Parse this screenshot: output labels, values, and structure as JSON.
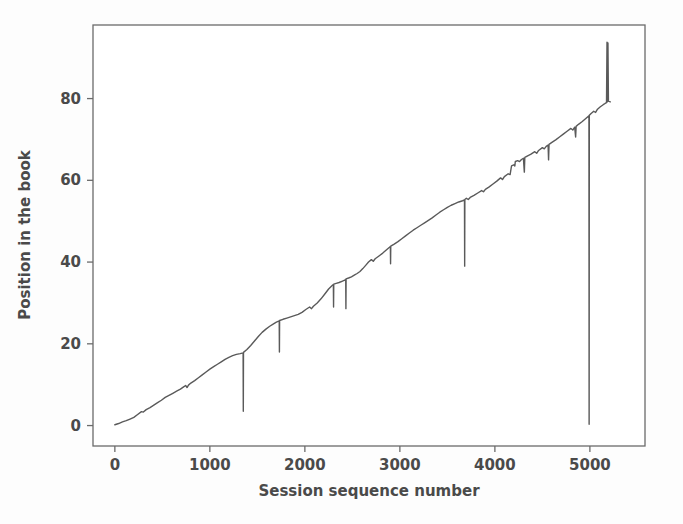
{
  "figure": {
    "background_color": "#fdfdfd",
    "line_color": "#5a5a5a",
    "axis_color": "#6b6b6b",
    "text_color": "#4a4a4a"
  },
  "chart_data": {
    "type": "line",
    "title": "",
    "xlabel": "Session sequence number",
    "ylabel": "Position in the book",
    "xlim": [
      -230,
      5580
    ],
    "ylim": [
      -5,
      98
    ],
    "xticks": [
      0,
      1000,
      2000,
      3000,
      4000,
      5000
    ],
    "xtick_labels": [
      "0",
      "1000",
      "2000",
      "3000",
      "4000",
      "5000"
    ],
    "yticks": [
      0,
      20,
      40,
      60,
      80
    ],
    "ytick_labels": [
      "0",
      "20",
      "40",
      "60",
      "80"
    ],
    "grid": false,
    "legend": null,
    "series": [
      {
        "name": "reading position",
        "color": "#5a5a5a",
        "linewidth": 1.4,
        "points": [
          [
            0,
            0.2
          ],
          [
            40,
            0.5
          ],
          [
            80,
            0.9
          ],
          [
            120,
            1.2
          ],
          [
            160,
            1.6
          ],
          [
            200,
            2.0
          ],
          [
            240,
            2.7
          ],
          [
            280,
            3.4
          ],
          [
            300,
            3.3
          ],
          [
            330,
            3.9
          ],
          [
            370,
            4.4
          ],
          [
            410,
            5.0
          ],
          [
            450,
            5.6
          ],
          [
            490,
            6.2
          ],
          [
            530,
            6.9
          ],
          [
            570,
            7.4
          ],
          [
            610,
            7.9
          ],
          [
            650,
            8.4
          ],
          [
            690,
            8.9
          ],
          [
            720,
            9.4
          ],
          [
            745,
            9.8
          ],
          [
            760,
            9.3
          ],
          [
            775,
            9.9
          ],
          [
            800,
            10.4
          ],
          [
            840,
            11.0
          ],
          [
            880,
            11.7
          ],
          [
            920,
            12.4
          ],
          [
            960,
            13.1
          ],
          [
            1000,
            13.8
          ],
          [
            1040,
            14.4
          ],
          [
            1080,
            15.0
          ],
          [
            1120,
            15.6
          ],
          [
            1160,
            16.2
          ],
          [
            1200,
            16.7
          ],
          [
            1240,
            17.1
          ],
          [
            1280,
            17.4
          ],
          [
            1320,
            17.6
          ],
          [
            1350,
            17.8
          ],
          [
            1352,
            3.5
          ],
          [
            1354,
            17.9
          ],
          [
            1390,
            18.6
          ],
          [
            1430,
            19.6
          ],
          [
            1470,
            20.7
          ],
          [
            1510,
            21.8
          ],
          [
            1550,
            22.8
          ],
          [
            1590,
            23.6
          ],
          [
            1630,
            24.3
          ],
          [
            1670,
            24.9
          ],
          [
            1700,
            25.3
          ],
          [
            1730,
            25.6
          ],
          [
            1732,
            18.0
          ],
          [
            1734,
            25.7
          ],
          [
            1770,
            26.0
          ],
          [
            1810,
            26.3
          ],
          [
            1850,
            26.6
          ],
          [
            1890,
            26.9
          ],
          [
            1930,
            27.2
          ],
          [
            1970,
            27.7
          ],
          [
            2010,
            28.4
          ],
          [
            2050,
            29.0
          ],
          [
            2070,
            28.6
          ],
          [
            2090,
            29.2
          ],
          [
            2130,
            30.0
          ],
          [
            2170,
            31.0
          ],
          [
            2210,
            32.2
          ],
          [
            2250,
            33.4
          ],
          [
            2290,
            34.3
          ],
          [
            2300,
            34.5
          ],
          [
            2302,
            29.0
          ],
          [
            2304,
            34.6
          ],
          [
            2330,
            34.8
          ],
          [
            2360,
            35.0
          ],
          [
            2390,
            35.3
          ],
          [
            2420,
            35.6
          ],
          [
            2430,
            35.8
          ],
          [
            2432,
            28.6
          ],
          [
            2434,
            35.9
          ],
          [
            2460,
            36.1
          ],
          [
            2490,
            36.4
          ],
          [
            2520,
            36.8
          ],
          [
            2550,
            37.2
          ],
          [
            2580,
            37.7
          ],
          [
            2610,
            38.4
          ],
          [
            2640,
            39.2
          ],
          [
            2670,
            40.0
          ],
          [
            2700,
            40.6
          ],
          [
            2720,
            40.2
          ],
          [
            2740,
            40.8
          ],
          [
            2780,
            41.5
          ],
          [
            2820,
            42.2
          ],
          [
            2860,
            43.0
          ],
          [
            2900,
            43.8
          ],
          [
            2902,
            39.6
          ],
          [
            2904,
            43.9
          ],
          [
            2940,
            44.4
          ],
          [
            2980,
            45.0
          ],
          [
            3020,
            45.7
          ],
          [
            3060,
            46.4
          ],
          [
            3100,
            47.1
          ],
          [
            3140,
            47.8
          ],
          [
            3180,
            48.4
          ],
          [
            3220,
            49.0
          ],
          [
            3260,
            49.6
          ],
          [
            3300,
            50.2
          ],
          [
            3340,
            50.8
          ],
          [
            3380,
            51.5
          ],
          [
            3420,
            52.2
          ],
          [
            3460,
            52.8
          ],
          [
            3500,
            53.4
          ],
          [
            3540,
            53.9
          ],
          [
            3580,
            54.3
          ],
          [
            3620,
            54.7
          ],
          [
            3660,
            55.0
          ],
          [
            3680,
            55.2
          ],
          [
            3682,
            39.0
          ],
          [
            3684,
            55.3
          ],
          [
            3700,
            55.6
          ],
          [
            3720,
            55.3
          ],
          [
            3740,
            55.8
          ],
          [
            3780,
            56.3
          ],
          [
            3820,
            56.9
          ],
          [
            3860,
            57.5
          ],
          [
            3880,
            57.2
          ],
          [
            3900,
            57.8
          ],
          [
            3940,
            58.4
          ],
          [
            3980,
            59.1
          ],
          [
            4020,
            59.8
          ],
          [
            4060,
            60.6
          ],
          [
            4080,
            60.2
          ],
          [
            4100,
            60.9
          ],
          [
            4140,
            61.6
          ],
          [
            4160,
            61.4
          ],
          [
            4175,
            63.5
          ],
          [
            4180,
            63.6
          ],
          [
            4200,
            63.8
          ],
          [
            4210,
            63.5
          ],
          [
            4215,
            64.6
          ],
          [
            4240,
            64.8
          ],
          [
            4260,
            64.6
          ],
          [
            4280,
            65.1
          ],
          [
            4300,
            65.4
          ],
          [
            4310,
            62.0
          ],
          [
            4315,
            65.6
          ],
          [
            4340,
            65.9
          ],
          [
            4380,
            66.4
          ],
          [
            4420,
            67.0
          ],
          [
            4440,
            66.6
          ],
          [
            4460,
            67.3
          ],
          [
            4500,
            68.0
          ],
          [
            4520,
            67.7
          ],
          [
            4540,
            68.3
          ],
          [
            4560,
            68.6
          ],
          [
            4565,
            65.0
          ],
          [
            4570,
            68.8
          ],
          [
            4600,
            69.3
          ],
          [
            4640,
            69.9
          ],
          [
            4680,
            70.6
          ],
          [
            4720,
            71.3
          ],
          [
            4760,
            72.0
          ],
          [
            4800,
            72.7
          ],
          [
            4820,
            72.3
          ],
          [
            4840,
            73.0
          ],
          [
            4850,
            70.6
          ],
          [
            4855,
            73.2
          ],
          [
            4880,
            73.7
          ],
          [
            4920,
            74.4
          ],
          [
            4960,
            75.2
          ],
          [
            4990,
            75.8
          ],
          [
            4992,
            0.3
          ],
          [
            4994,
            75.9
          ],
          [
            5010,
            76.3
          ],
          [
            5040,
            76.9
          ],
          [
            5060,
            76.6
          ],
          [
            5080,
            77.4
          ],
          [
            5110,
            78.0
          ],
          [
            5140,
            78.5
          ],
          [
            5160,
            78.8
          ],
          [
            5175,
            79.0
          ],
          [
            5180,
            93.8
          ],
          [
            5185,
            79.2
          ],
          [
            5190,
            93.6
          ],
          [
            5195,
            79.4
          ],
          [
            5200,
            79.3
          ],
          [
            5215,
            79.2
          ]
        ]
      }
    ],
    "annotations": [
      {
        "label": "reset-drop",
        "x": 1350,
        "from": 17.8,
        "to": 3.5
      },
      {
        "label": "reset-drop",
        "x": 1730,
        "from": 25.6,
        "to": 18.0
      },
      {
        "label": "reset-drop",
        "x": 2300,
        "from": 34.5,
        "to": 29.0
      },
      {
        "label": "reset-drop",
        "x": 2430,
        "from": 35.8,
        "to": 28.6
      },
      {
        "label": "reset-drop",
        "x": 2900,
        "from": 43.8,
        "to": 39.6
      },
      {
        "label": "reset-drop",
        "x": 3680,
        "from": 55.2,
        "to": 39.0
      },
      {
        "label": "reset-drop",
        "x": 4990,
        "from": 75.8,
        "to": 0.3
      },
      {
        "label": "end-spike",
        "x": 5180,
        "from": 79.0,
        "to": 93.8
      }
    ]
  }
}
